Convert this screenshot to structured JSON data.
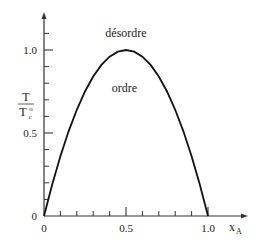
{
  "chart_data": {
    "type": "line",
    "title": "",
    "xlabel": "x",
    "xlabel_sub": "A",
    "ylabel": {
      "numerator": "T",
      "denominator": "T",
      "denominator_sub": "c",
      "denominator_sup": "o"
    },
    "xlim": [
      0,
      1.15
    ],
    "ylim": [
      0,
      1.2
    ],
    "x_ticks": [
      {
        "value": 0,
        "label": "0"
      },
      {
        "value": 0.5,
        "label": "0.5"
      },
      {
        "value": 1.0,
        "label": "1.0"
      }
    ],
    "y_ticks": [
      {
        "value": 0,
        "label": "0"
      },
      {
        "value": 0.5,
        "label": "0.5"
      },
      {
        "value": 1.0,
        "label": "1.0"
      }
    ],
    "x_minor_step": 0.1,
    "y_minor_step": 0.1,
    "grid": false,
    "series": [
      {
        "name": "T/Tc (order-disorder boundary)",
        "x": [
          0,
          0.05,
          0.1,
          0.15,
          0.2,
          0.25,
          0.3,
          0.35,
          0.4,
          0.45,
          0.5,
          0.55,
          0.6,
          0.65,
          0.7,
          0.75,
          0.8,
          0.85,
          0.9,
          0.95,
          1.0
        ],
        "y": [
          0,
          0.19,
          0.36,
          0.51,
          0.64,
          0.75,
          0.84,
          0.91,
          0.96,
          0.99,
          1.0,
          0.99,
          0.96,
          0.91,
          0.84,
          0.75,
          0.64,
          0.51,
          0.36,
          0.19,
          0
        ]
      }
    ],
    "annotations": [
      {
        "text": "désordre",
        "x": 0.5,
        "y": 1.1
      },
      {
        "text": "ordre",
        "x": 0.49,
        "y": 0.77
      }
    ]
  }
}
